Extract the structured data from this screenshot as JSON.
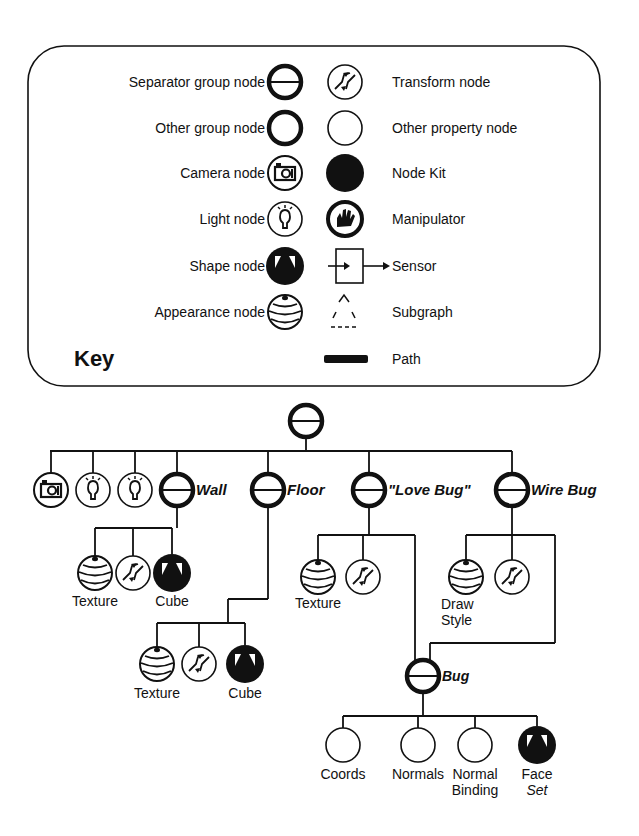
{
  "key": {
    "title": "Key",
    "left_entries": [
      {
        "label": "Separator group node",
        "icon": "separator-group-node-icon"
      },
      {
        "label": "Other group node",
        "icon": "group-node-icon"
      },
      {
        "label": "Camera node",
        "icon": "camera-node-icon"
      },
      {
        "label": "Light node",
        "icon": "light-node-icon"
      },
      {
        "label": "Shape node",
        "icon": "shape-node-icon"
      },
      {
        "label": "Appearance node",
        "icon": "appearance-node-icon"
      }
    ],
    "right_entries": [
      {
        "label": "Transform node",
        "icon": "transform-node-icon"
      },
      {
        "label": "Other property node",
        "icon": "property-node-icon"
      },
      {
        "label": "Node Kit",
        "icon": "node-kit-icon"
      },
      {
        "label": "Manipulator",
        "icon": "manipulator-icon"
      },
      {
        "label": "Sensor",
        "icon": "sensor-icon"
      },
      {
        "label": "Subgraph",
        "icon": "subgraph-icon"
      },
      {
        "label": "Path",
        "icon": "path-icon"
      }
    ]
  },
  "tree": {
    "root": {
      "type": "separator"
    },
    "level1": [
      {
        "type": "camera",
        "label": ""
      },
      {
        "type": "light",
        "label": ""
      },
      {
        "type": "light",
        "label": ""
      },
      {
        "type": "separator",
        "label": "Wall"
      },
      {
        "type": "separator",
        "label": "Floor"
      },
      {
        "type": "separator",
        "label": "\"Love Bug\""
      },
      {
        "type": "separator",
        "label": "Wire Bug"
      }
    ],
    "wall_children": [
      {
        "type": "appearance",
        "label": "Texture"
      },
      {
        "type": "transform",
        "label": ""
      },
      {
        "type": "shape",
        "label": "Cube"
      }
    ],
    "floor_children": [
      {
        "type": "appearance",
        "label": "Texture"
      },
      {
        "type": "transform",
        "label": ""
      },
      {
        "type": "shape",
        "label": "Cube"
      }
    ],
    "lovebug_children": [
      {
        "type": "appearance",
        "label": "Texture"
      },
      {
        "type": "transform",
        "label": ""
      }
    ],
    "wirebug_children": [
      {
        "type": "appearance",
        "label": "Draw Style",
        "label_lines": [
          "Draw",
          "Style"
        ]
      },
      {
        "type": "transform",
        "label": ""
      }
    ],
    "bug": {
      "type": "separator",
      "label": "Bug"
    },
    "bug_children": [
      {
        "type": "property",
        "label": "Coords",
        "label_lines": [
          "Coords"
        ]
      },
      {
        "type": "property",
        "label": "Normals",
        "label_lines": [
          "Normals"
        ]
      },
      {
        "type": "property",
        "label": "Normal Binding",
        "label_lines": [
          "Normal",
          "Binding"
        ]
      },
      {
        "type": "shape",
        "label": "Face Set",
        "label_lines": [
          "Face",
          "Set"
        ]
      }
    ]
  }
}
